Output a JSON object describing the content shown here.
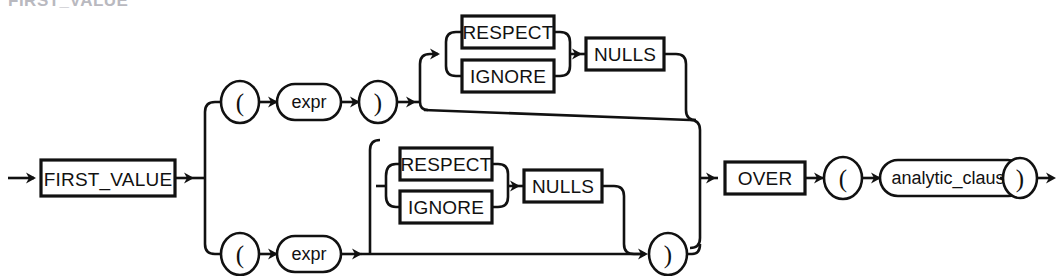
{
  "diagram": {
    "type": "railroad-syntax-diagram",
    "name": "first_value",
    "title_remnant": "FIRST_VALUE",
    "background_color": "#ffffff",
    "line_color": "#111111",
    "nodes": {
      "keyword_first_value": "FIRST_VALUE",
      "keyword_over": "OVER",
      "keyword_nulls_top": "NULLS",
      "keyword_nulls_bottom": "NULLS",
      "keyword_respect_top": "RESPECT",
      "keyword_ignore_top": "IGNORE",
      "keyword_respect_bottom": "RESPECT",
      "keyword_ignore_bottom": "IGNORE",
      "expr_top": "expr",
      "expr_bottom": "expr",
      "analytic_clause": "analytic_clause",
      "lparen_top": "(",
      "rparen_top": ")",
      "lparen_bottom": "(",
      "rparen_bottom": ")",
      "lparen_over": "(",
      "rparen_over": ")"
    },
    "paths": [
      "FIRST_VALUE ( expr ) [RESPECT|IGNORE NULLS] OVER ( analytic_clause )",
      "FIRST_VALUE ( expr [RESPECT|IGNORE NULLS] ) OVER ( analytic_clause )"
    ]
  }
}
